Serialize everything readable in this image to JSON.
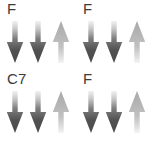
{
  "figure": {
    "background_color": "#ffffff",
    "label_color": "#3b3b3b",
    "colors": {
      "down_arrow_dark": "#4a4a4a",
      "down_arrow_fade": "#f2f2f2",
      "up_arrow_light": "#b6b6b6",
      "up_arrow_fade": "#f4f4f4"
    },
    "panels": [
      {
        "id": "panel-top-left",
        "label": "F",
        "arrows": [
          {
            "name": "arrow-1",
            "direction": "down",
            "shade": "dark"
          },
          {
            "name": "arrow-2",
            "direction": "down",
            "shade": "dark"
          },
          {
            "name": "arrow-3",
            "direction": "up",
            "shade": "light"
          }
        ]
      },
      {
        "id": "panel-top-right",
        "label": "F",
        "arrows": [
          {
            "name": "arrow-1",
            "direction": "down",
            "shade": "dark"
          },
          {
            "name": "arrow-2",
            "direction": "down",
            "shade": "dark"
          },
          {
            "name": "arrow-3",
            "direction": "up",
            "shade": "light"
          }
        ]
      },
      {
        "id": "panel-bottom-left",
        "label": "C7",
        "arrows": [
          {
            "name": "arrow-1",
            "direction": "down",
            "shade": "dark"
          },
          {
            "name": "arrow-2",
            "direction": "down",
            "shade": "dark"
          },
          {
            "name": "arrow-3",
            "direction": "up",
            "shade": "light"
          }
        ]
      },
      {
        "id": "panel-bottom-right",
        "label": "F",
        "arrows": [
          {
            "name": "arrow-1",
            "direction": "down",
            "shade": "dark"
          },
          {
            "name": "arrow-2",
            "direction": "down",
            "shade": "dark"
          },
          {
            "name": "arrow-3",
            "direction": "up",
            "shade": "light"
          }
        ]
      }
    ]
  }
}
